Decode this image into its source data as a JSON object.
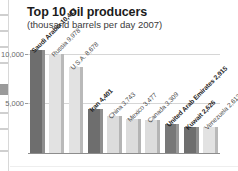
{
  "chart_data": {
    "type": "bar",
    "title": "Top 10 oil producers",
    "subtitle": "(thousand barrels per day 2007)",
    "xlabel": "",
    "ylabel": "",
    "ylim": [
      0,
      12000
    ],
    "grid": true,
    "legend": "none",
    "ytick_labels": [
      "5,000",
      "10,000"
    ],
    "ytick_values": [
      5000,
      10000
    ],
    "categories": [
      "Saudi Arabia",
      "Russia",
      "U.S.A.",
      "Iran",
      "China",
      "Mexico",
      "Canada",
      "United Arab Emirates",
      "Kuwait",
      "Venezuela"
    ],
    "values": [
      10413,
      9978,
      8678,
      4401,
      3743,
      3477,
      3309,
      2915,
      2626,
      2613
    ],
    "point_labels": [
      "Saudi Arabia 10,413",
      "Russia 9,978",
      "U.S.A. 8,678",
      "Iran 4,401",
      "China 3,743",
      "Mexico 3,477",
      "Canada 3,309",
      "United Arab Emirates 2,915",
      "Kuwait 2,626",
      "Venezuela 2,613"
    ],
    "bar_colors": [
      "#6e6e6e",
      "#e2e2e2",
      "#e2e2e2",
      "#6e6e6e",
      "#dcdcdc",
      "#dcdcdc",
      "#dcdcdc",
      "#787878",
      "#6e6e6e",
      "#e2e2e2"
    ],
    "bar_side_colors": [
      "#8f8f8f",
      "#b9b9b9",
      "#b9b9b9",
      "#8f8f8f",
      "#b4b4b4",
      "#b4b4b4",
      "#b4b4b4",
      "#989898",
      "#8f8f8f",
      "#b9b9b9"
    ],
    "label_emphasis": [
      true,
      false,
      false,
      true,
      false,
      false,
      false,
      true,
      true,
      false
    ]
  },
  "colors": {
    "background": "#ffffff",
    "title_text": "#1b1b1b",
    "subtitle_text": "#3a3a3a",
    "axis_text": "#6b6b6b",
    "gridline": "#d6d6d6",
    "baseline": "#8d8d8d"
  }
}
